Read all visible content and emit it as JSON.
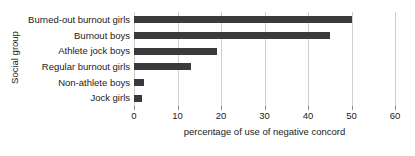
{
  "chart_data": {
    "type": "bar",
    "orientation": "horizontal",
    "title": "",
    "xlabel": "percentage of use of negative concord",
    "ylabel": "Social group",
    "categories": [
      "Burned-out burnout girls",
      "Burnout boys",
      "Athlete jock boys",
      "Regular burnout girls",
      "Non-athlete boys",
      "Jock girls"
    ],
    "values": [
      50,
      45,
      19,
      13,
      2.3,
      1.8
    ],
    "xlim": [
      0,
      60
    ],
    "xticks": [
      0,
      10,
      20,
      30,
      40,
      50,
      60
    ],
    "xtick_labels": [
      "0",
      "10",
      "20",
      "30",
      "40",
      "50",
      "60"
    ],
    "grid": true,
    "grid_axis": "x",
    "legend": false,
    "bar_color": "#3a3a3a",
    "grid_color": "#cfcfcf",
    "background_color": "#ffffff"
  }
}
